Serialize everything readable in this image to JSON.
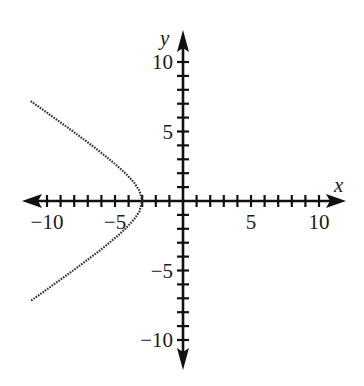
{
  "chart_data": {
    "type": "line",
    "title": "",
    "xlabel": "x",
    "ylabel": "y",
    "xlim": [
      -11.5,
      11.5
    ],
    "ylim": [
      -11.5,
      11.5
    ],
    "grid": false,
    "x_ticks": {
      "major_labeled": [
        -10,
        -5,
        5,
        10
      ],
      "minor_step": 1
    },
    "y_ticks": {
      "major_labeled": [
        10,
        5,
        -5,
        -10
      ],
      "minor_step": 1
    },
    "tick_labels": {
      "x": [
        "−10",
        "−5",
        "5",
        "10"
      ],
      "y": [
        "10",
        "5",
        "−5",
        "−10"
      ]
    },
    "series": [
      {
        "name": "left branch of hyperbola x²/9 − y²/4 = 1",
        "style": "dotted",
        "color": "#333333",
        "x": [
          -11.2,
          -10.4,
          -9.6,
          -8.8,
          -8.0,
          -7.2,
          -6.4,
          -5.6,
          -4.8,
          -4.2,
          -3.6,
          -3.2,
          -3.0,
          -3.2,
          -3.6,
          -4.2,
          -4.8,
          -5.6,
          -6.4,
          -7.2,
          -8.0,
          -8.8,
          -9.6,
          -10.4,
          -11.2
        ],
        "y": [
          7.19,
          6.63,
          6.07,
          5.51,
          4.94,
          4.36,
          3.77,
          3.15,
          2.5,
          1.96,
          1.33,
          0.74,
          0.0,
          -0.74,
          -1.33,
          -1.96,
          -2.5,
          -3.15,
          -3.77,
          -4.36,
          -4.94,
          -5.51,
          -6.07,
          -6.63,
          -7.19
        ]
      }
    ],
    "annotations": []
  },
  "axes": {
    "x_name": "x",
    "y_name": "y",
    "color": "#111111"
  }
}
